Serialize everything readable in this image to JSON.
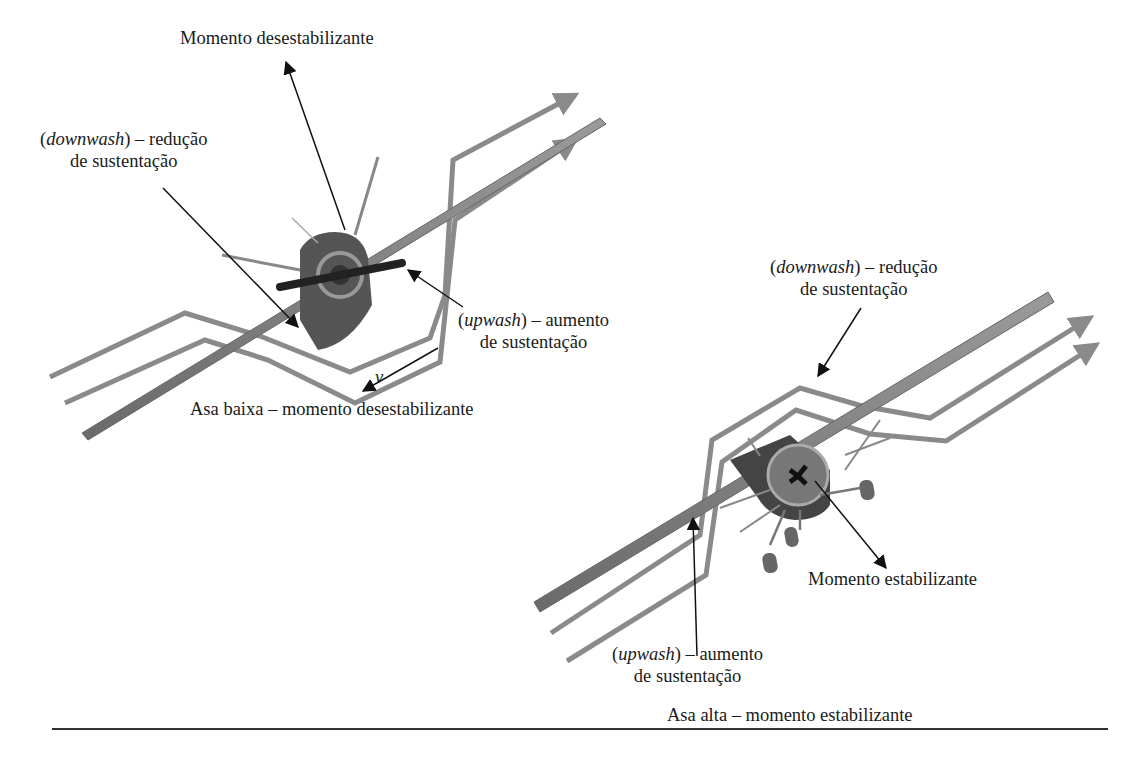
{
  "figure": {
    "left_panel": {
      "caption": "Asa baixa – momento desestabilizante",
      "moment_label": "Momento desestabilizante",
      "downwash_label": {
        "term": "downwash",
        "line1_suffix": ") – redução",
        "line2": "de sustentação"
      },
      "upwash_label": {
        "term": "upwash",
        "line1_suffix": ") – aumento",
        "line2": "de sustentação"
      },
      "velocity_symbol": "v"
    },
    "right_panel": {
      "caption": "Asa alta – momento estabilizante",
      "moment_label": "Momento estabilizante",
      "downwash_label": {
        "term": "downwash",
        "line1_suffix": ") – redução",
        "line2": "de sustentação"
      },
      "upwash_label": {
        "term": "upwash",
        "line1_suffix": ") – aumento",
        "line2": "de sustentação"
      }
    },
    "colors": {
      "flow_lines": "#8a8a8a",
      "wing": "#7a7a7a",
      "fuselage": "#5a5a5a",
      "text": "#1a1a1a"
    }
  }
}
